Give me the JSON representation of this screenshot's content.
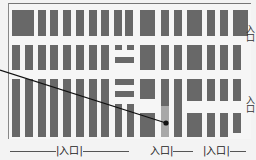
{
  "map": {
    "type": "parking-lot-layout",
    "colors": {
      "background": "#f3f3f3",
      "stall": "#686868",
      "highlight": "#a8a8a8",
      "pointer": "#111111"
    },
    "entrances_bottom": [
      {
        "label": "入口",
        "x": 62
      },
      {
        "label": "入口",
        "x": 153
      },
      {
        "label": "入口",
        "x": 210
      }
    ],
    "entrances_right": [
      {
        "label": "入口",
        "y": 22
      },
      {
        "label": "入口",
        "y": 93
      }
    ],
    "pointer": {
      "from": [
        0,
        70
      ],
      "to": [
        166,
        123
      ],
      "marker": "dot"
    },
    "rows": [
      {
        "name": "row-1",
        "top": 10,
        "height": 26
      },
      {
        "name": "row-2",
        "top": 45,
        "height": 25
      },
      {
        "name": "row-3",
        "top": 79,
        "height": 58
      }
    ]
  }
}
